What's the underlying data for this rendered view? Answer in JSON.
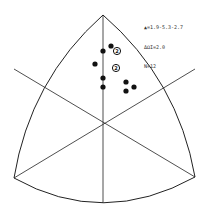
{
  "diagram": {
    "type": "ternary-stereographic-plot",
    "outline_color": "#222222",
    "point_color": "#111111",
    "vertices": {
      "top": [
        103,
        15
      ],
      "bottom_left": [
        14,
        178
      ],
      "bottom_right": [
        195,
        177
      ],
      "bottom_mid": [
        103,
        203
      ]
    },
    "center": [
      104,
      123
    ],
    "divider_lines": [
      {
        "from": [
          103,
          15
        ],
        "to": [
          103,
          203
        ]
      },
      {
        "from": [
          14,
          69
        ],
        "to": [
          195,
          177
        ]
      },
      {
        "from": [
          14,
          178
        ],
        "to": [
          195,
          69
        ]
      }
    ],
    "points": [
      {
        "x": 111,
        "y": 46,
        "count": 1
      },
      {
        "x": 103,
        "y": 51,
        "count": 1
      },
      {
        "x": 117,
        "y": 51,
        "count": 2
      },
      {
        "x": 95,
        "y": 64,
        "count": 1
      },
      {
        "x": 116,
        "y": 68,
        "count": 2
      },
      {
        "x": 103,
        "y": 78,
        "count": 1
      },
      {
        "x": 126,
        "y": 82,
        "count": 1
      },
      {
        "x": 103,
        "y": 87,
        "count": 1
      },
      {
        "x": 134,
        "y": 87,
        "count": 1
      },
      {
        "x": 126,
        "y": 91,
        "count": 1
      }
    ]
  },
  "legend": {
    "line1": "▲=1.9-5.3-2.7",
    "line2": "ΔΩI=2.0",
    "line3": "N=12"
  }
}
